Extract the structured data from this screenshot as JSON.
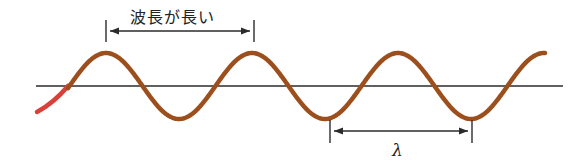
{
  "diagram": {
    "title": "",
    "labels": {
      "top_annotation": "波長が長い",
      "bottom_annotation": "λ"
    },
    "colors": {
      "wave": "#9c4f1c",
      "wave_start": "#d9403a",
      "axis": "#2b2b2b",
      "arrow": "#2b2b2b",
      "text": "#222222"
    },
    "wave": {
      "baseline_y": 86,
      "amplitude_px": 33,
      "period_px": 146,
      "peaks_x": [
        106,
        254,
        398
      ],
      "troughs_x": [
        181,
        330,
        472
      ]
    },
    "annotations": [
      {
        "text": "波長が長い",
        "from_x": 106,
        "to_x": 254,
        "position": "above"
      },
      {
        "text": "λ",
        "from_x": 330,
        "to_x": 472,
        "position": "below"
      }
    ]
  }
}
